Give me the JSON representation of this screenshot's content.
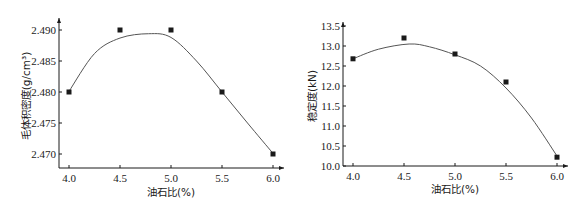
{
  "chart_data": [
    {
      "type": "scatter",
      "title": "",
      "xlabel": "油石比(%)",
      "ylabel": "毛体积密度(g/cm³)",
      "x": [
        4.0,
        4.5,
        5.0,
        5.5,
        6.0
      ],
      "series": [
        {
          "name": "毛体积密度",
          "values": [
            2.48,
            2.49,
            2.49,
            2.48,
            2.47
          ],
          "marker": "square"
        }
      ],
      "fit_curve": {
        "type": "polynomial",
        "peak_x": 4.78,
        "peak_y": 2.4894
      },
      "xticks": [
        "4.0",
        "4.5",
        "5.0",
        "5.5",
        "6.0"
      ],
      "yticks": [
        "2.470",
        "2.475",
        "2.480",
        "2.485",
        "2.490"
      ],
      "xlim": [
        3.8,
        6.15
      ],
      "ylim": [
        2.4678,
        2.4922
      ],
      "grid": false,
      "legend": null
    },
    {
      "type": "scatter",
      "title": "",
      "xlabel": "油石比(%)",
      "ylabel": "稳定度(kN)",
      "x": [
        4.0,
        4.5,
        5.0,
        5.5,
        6.0
      ],
      "series": [
        {
          "name": "稳定度",
          "values": [
            12.68,
            13.2,
            12.8,
            12.1,
            10.22
          ],
          "marker": "square"
        }
      ],
      "fit_curve": {
        "type": "polynomial",
        "peak_x": 4.55,
        "peak_y": 13.05
      },
      "xticks": [
        "4.0",
        "4.5",
        "5.0",
        "5.5",
        "6.0"
      ],
      "yticks": [
        "10.0",
        "10.5",
        "11.0",
        "11.5",
        "12.0",
        "12.5",
        "13.0",
        "13.5"
      ],
      "xlim": [
        3.8,
        6.15
      ],
      "ylim": [
        10.0,
        13.6
      ],
      "grid": false,
      "legend": null
    }
  ],
  "colors": {
    "ink": "#1a1a1a",
    "curve": "#555555",
    "background": "#ffffff"
  }
}
